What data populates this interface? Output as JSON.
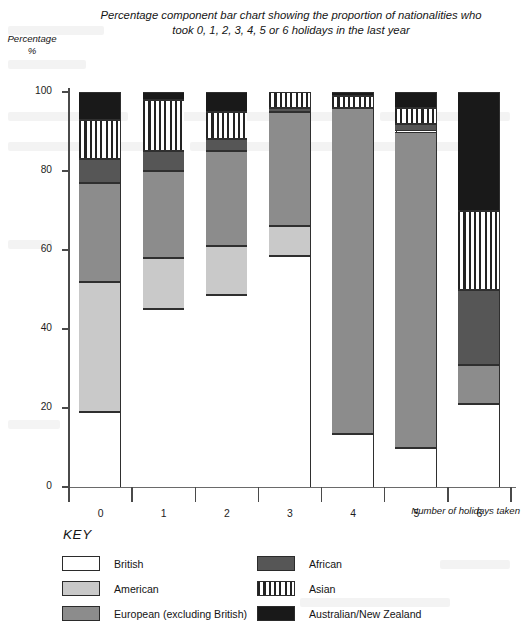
{
  "chart_data": {
    "type": "bar",
    "subtype": "percentage-component-stacked",
    "title": "Percentage component bar chart showing the proportion of nationalities who took 0, 1, 2, 3, 4, 5 or 6 holidays in the last year",
    "xlabel": "Number of holidays taken",
    "ylabel": "Percentage\n%",
    "ylabel_line1": "Percentage",
    "ylabel_line2": "%",
    "categories": [
      "0",
      "1",
      "2",
      "3",
      "4",
      "5",
      "6"
    ],
    "ylim": [
      0,
      100
    ],
    "yticks": [
      0,
      20,
      40,
      60,
      80,
      100
    ],
    "grid": false,
    "legend_title": "KEY",
    "legend_position": "below-axes",
    "series": [
      {
        "name": "British",
        "fill": "solid",
        "color": "#ffffff",
        "values": [
          19,
          45,
          48.5,
          58.5,
          13.5,
          10,
          21
        ]
      },
      {
        "name": "American",
        "fill": "solid",
        "color": "#c9c9c9",
        "values": [
          33,
          13,
          12.5,
          7.5,
          0,
          0,
          0
        ]
      },
      {
        "name": "European (excluding British)",
        "fill": "solid",
        "color": "#8c8c8c",
        "values": [
          25,
          22,
          24,
          29,
          82.5,
          80,
          10
        ]
      },
      {
        "name": "African",
        "fill": "solid",
        "color": "#565656",
        "values": [
          6,
          5,
          3,
          1,
          0,
          2,
          19
        ]
      },
      {
        "name": "Asian",
        "fill": "vertical-stripes",
        "color": "#ffffff",
        "values": [
          10,
          13,
          7,
          4,
          3,
          4,
          20
        ]
      },
      {
        "name": "Australian/New Zealand",
        "fill": "solid",
        "color": "#191919",
        "values": [
          7,
          2,
          5,
          0,
          1,
          4,
          30
        ]
      }
    ]
  },
  "legend": {
    "title": "KEY",
    "left_column": [
      {
        "label": "British",
        "swatch": "sw-british"
      },
      {
        "label": "American",
        "swatch": "sw-american"
      },
      {
        "label": "European (excluding British)",
        "swatch": "sw-european"
      }
    ],
    "right_column": [
      {
        "label": "African",
        "swatch": "sw-african"
      },
      {
        "label": "Asian",
        "swatch": "sw-asian"
      },
      {
        "label": "Australian/New Zealand",
        "swatch": "sw-aunz"
      }
    ]
  }
}
